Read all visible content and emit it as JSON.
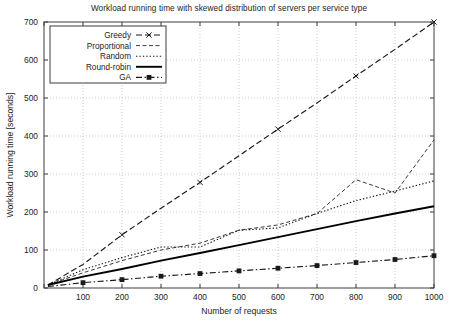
{
  "chart_data": {
    "type": "line",
    "title": "Workload running time with skewed distribution of servers per service type",
    "xlabel": "Number of requests",
    "ylabel": "Workload running time [seconds]",
    "xlim": [
      0,
      1000
    ],
    "ylim": [
      0,
      700
    ],
    "xticks": [
      0,
      100,
      200,
      300,
      400,
      500,
      600,
      700,
      800,
      900,
      1000
    ],
    "yticks": [
      0,
      100,
      200,
      300,
      400,
      500,
      600,
      700
    ],
    "grid": true,
    "legend_position": "top-left",
    "x": [
      10,
      100,
      200,
      300,
      400,
      500,
      600,
      700,
      800,
      900,
      1000
    ],
    "series": [
      {
        "name": "Greedy",
        "style": "dashed-x",
        "color": "#1a1a1a",
        "marker": "x",
        "values": [
          8,
          62,
          140,
          210,
          278,
          348,
          418,
          487,
          558,
          628,
          700
        ]
      },
      {
        "name": "Proportional",
        "style": "dashed",
        "color": "#3a3a3a",
        "marker": "none",
        "values": [
          8,
          40,
          72,
          100,
          118,
          152,
          166,
          196,
          285,
          250,
          390
        ]
      },
      {
        "name": "Random",
        "style": "dotted",
        "color": "#1a1a1a",
        "marker": "none",
        "values": [
          8,
          48,
          80,
          108,
          108,
          152,
          158,
          196,
          230,
          255,
          282
        ]
      },
      {
        "name": "Round-robin",
        "style": "solid",
        "color": "#000000",
        "marker": "none",
        "values": [
          8,
          30,
          50,
          72,
          92,
          113,
          134,
          155,
          176,
          196,
          215
        ]
      },
      {
        "name": "GA",
        "style": "dash-dot-square",
        "color": "#1a1a1a",
        "marker": "square",
        "values": [
          4,
          14,
          22,
          31,
          38,
          45,
          52,
          59,
          67,
          75,
          85
        ]
      }
    ]
  },
  "legend": {
    "items": [
      {
        "label": "Greedy"
      },
      {
        "label": "Proportional"
      },
      {
        "label": "Random"
      },
      {
        "label": "Round-robin"
      },
      {
        "label": "GA"
      }
    ]
  }
}
